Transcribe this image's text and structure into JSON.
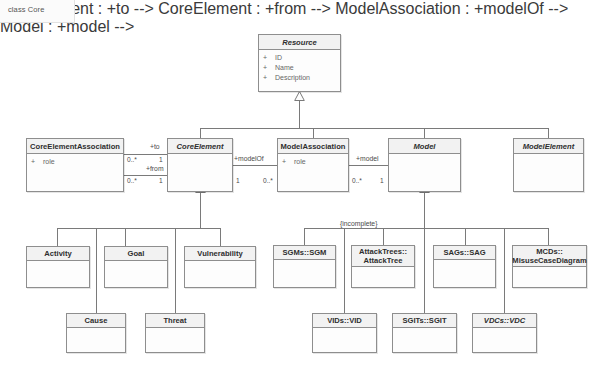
{
  "frame": {
    "label": "class Core"
  },
  "palette": {
    "line": "#7a7a7a",
    "box_border": "#8e8e8e",
    "header_fill": "#f2f2f2",
    "body_fill": "#fdfdfd",
    "text": "#2e2e2e",
    "attr_text": "#666666",
    "background": "#ffffff"
  },
  "classes": [
    {
      "id": "resource",
      "name": "Resource",
      "abstract": true,
      "attributes": [
        {
          "visibility": "+",
          "name": "ID"
        },
        {
          "visibility": "+",
          "name": "Name"
        },
        {
          "visibility": "+",
          "name": "Description"
        }
      ]
    },
    {
      "id": "core-element-association",
      "name": "CoreElementAssociation",
      "abstract": false,
      "attributes": [
        {
          "visibility": "+",
          "name": "role"
        }
      ]
    },
    {
      "id": "core-element",
      "name": "CoreElement",
      "abstract": true,
      "attributes": []
    },
    {
      "id": "model-association",
      "name": "ModelAssociation",
      "abstract": false,
      "attributes": [
        {
          "visibility": "+",
          "name": "role"
        }
      ]
    },
    {
      "id": "model",
      "name": "Model",
      "abstract": true,
      "attributes": []
    },
    {
      "id": "model-element",
      "name": "ModelElement",
      "abstract": true,
      "attributes": []
    },
    {
      "id": "activity",
      "name": "Activity",
      "abstract": false,
      "attributes": []
    },
    {
      "id": "goal",
      "name": "Goal",
      "abstract": false,
      "attributes": []
    },
    {
      "id": "vulnerability",
      "name": "Vulnerability",
      "abstract": false,
      "attributes": []
    },
    {
      "id": "cause",
      "name": "Cause",
      "abstract": false,
      "attributes": []
    },
    {
      "id": "threat",
      "name": "Threat",
      "abstract": false,
      "attributes": []
    },
    {
      "id": "sgm",
      "name": "SGMs::SGM",
      "abstract": false,
      "attributes": []
    },
    {
      "id": "attack-tree",
      "name": "AttackTrees::\nAttackTree",
      "abstract": false,
      "attributes": []
    },
    {
      "id": "sag",
      "name": "SAGs::SAG",
      "abstract": false,
      "attributes": []
    },
    {
      "id": "mcd",
      "name": "MCDs::\nMisuseCaseDiagram",
      "abstract": false,
      "attributes": []
    },
    {
      "id": "vid",
      "name": "VIDs::VID",
      "abstract": false,
      "attributes": []
    },
    {
      "id": "sgit",
      "name": "SGITs::SGIT",
      "abstract": false,
      "attributes": []
    },
    {
      "id": "vdc",
      "name": "VDCs::VDC",
      "abstract": true,
      "attributes": []
    }
  ],
  "associations": {
    "to": {
      "role": "+to",
      "source_mult": "0..*",
      "target_mult": "1"
    },
    "from": {
      "role": "+from",
      "source_mult": "0..*",
      "target_mult": "1"
    },
    "modelOf": {
      "role": "+modelOf",
      "source_mult": "1",
      "target_mult": "0..*"
    },
    "model": {
      "role": "+model",
      "source_mult": "0..*",
      "target_mult": "1"
    }
  },
  "constraints": {
    "model_generalization": "{incomplete}"
  }
}
